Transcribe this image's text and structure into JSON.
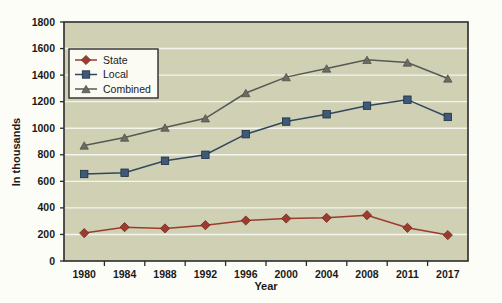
{
  "chart_data": {
    "type": "line",
    "title": "",
    "xlabel": "Year",
    "ylabel": "In thousands",
    "categories": [
      "1980",
      "1984",
      "1988",
      "1992",
      "1996",
      "2000",
      "2004",
      "2008",
      "2011",
      "2017"
    ],
    "x": [
      1980,
      1984,
      1988,
      1992,
      1996,
      2000,
      2004,
      2008,
      2011,
      2017
    ],
    "series": [
      {
        "name": "State",
        "marker": "diamond",
        "color": "#9c3b2e",
        "values": [
          210,
          255,
          245,
          270,
          305,
          320,
          325,
          345,
          250,
          195
        ]
      },
      {
        "name": "Local",
        "marker": "square",
        "color": "#3d5a7a",
        "values": [
          655,
          665,
          755,
          800,
          955,
          1050,
          1105,
          1170,
          1215,
          1085
        ]
      },
      {
        "name": "Combined",
        "marker": "triangle",
        "color": "#6b6b63",
        "values": [
          870,
          930,
          1005,
          1075,
          1265,
          1385,
          1450,
          1515,
          1495,
          1375
        ]
      }
    ],
    "ylim": [
      0,
      1800
    ],
    "yticks": [
      0,
      200,
      400,
      600,
      800,
      1000,
      1200,
      1400,
      1600,
      1800
    ],
    "ytick_labels": [
      "0",
      "200",
      "400",
      "600",
      "800",
      "1000",
      "1200",
      "1400",
      "1600",
      "1800"
    ],
    "grid": true,
    "grid_axis": "y",
    "legend_position": "upper-left-inside",
    "plot_background": "#cfd0b4",
    "figure_background": "#fdfdf8",
    "grid_color": "#f4f5ec",
    "axis_color": "#2b2b2b"
  }
}
